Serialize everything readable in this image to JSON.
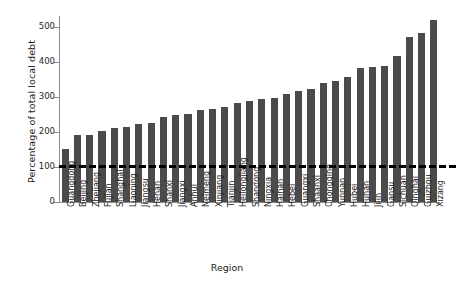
{
  "chart_data": {
    "type": "bar",
    "title": "",
    "xlabel": "Region",
    "ylabel": "Percentage of total local debt",
    "ylim": [
      0,
      530
    ],
    "yticks": [
      0,
      100,
      200,
      300,
      400,
      500
    ],
    "ytick_labels": [
      "0",
      "100",
      "200",
      "300",
      "400",
      "500"
    ],
    "grid": false,
    "legend": "none",
    "bar_color": "#4b4b4b",
    "reference_line": {
      "value": 100,
      "style": "dashed",
      "color": "#000000",
      "width": 3
    },
    "categories": [
      "Guangdong",
      "Beijing",
      "Zhejiang",
      "Fujian",
      "Shanghai",
      "Liaoning",
      "Jiangsu",
      "Henan",
      "Shanxi",
      "Jiangxi",
      "Anhui",
      "Neimeng",
      "Xinjiang",
      "Tianjin",
      "Heilongjiang",
      "Shandong",
      "Ningxia",
      "Hainan",
      "Hebei",
      "Guangxi",
      "Shaanxi",
      "Chongqing",
      "Yunnan",
      "Hubei",
      "Hunan",
      "Jilin",
      "Gansu",
      "Sichuan",
      "Qinghai",
      "Guizhou",
      "Xizang"
    ],
    "values": [
      152,
      190,
      192,
      203,
      212,
      215,
      221,
      224,
      242,
      249,
      252,
      262,
      265,
      272,
      283,
      289,
      293,
      296,
      308,
      317,
      322,
      338,
      345,
      355,
      383,
      386,
      388,
      417,
      470,
      481,
      518
    ]
  },
  "axis": {
    "y_title": "Percentage of total local debt",
    "x_title": "Region"
  }
}
